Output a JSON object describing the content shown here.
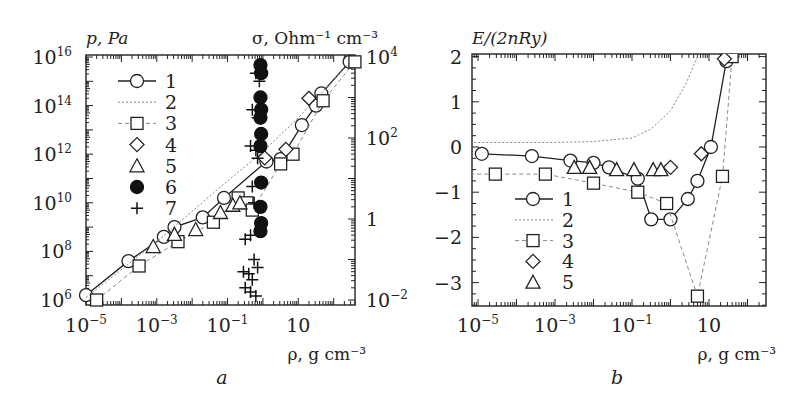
{
  "figure": {
    "panels": [
      "a",
      "b"
    ]
  },
  "chart_data": [
    {
      "panel": "a",
      "type": "scatter",
      "title": "",
      "xlabel": "ρ, g cm⁻³",
      "ylabel_left": "p, Pa",
      "ylabel_right": "σ, Ohm⁻¹ cm⁻³",
      "xscale": "log",
      "yscale_left": "log",
      "yscale_right": "log",
      "xlim": [
        1e-05,
        400
      ],
      "ylim_left": [
        1000000.0,
        1e+16
      ],
      "ylim_right": [
        0.01,
        10000.0
      ],
      "x_ticks": [
        {
          "base": "10",
          "exp": "−5",
          "v": -5
        },
        {
          "base": "10",
          "exp": "−3",
          "v": -3
        },
        {
          "base": "10",
          "exp": "−1",
          "v": -1
        },
        {
          "base": "10",
          "exp": "",
          "v": 1
        }
      ],
      "y_ticks_left": [
        {
          "base": "10",
          "exp": "16",
          "v": 16
        },
        {
          "base": "10",
          "exp": "14",
          "v": 14
        },
        {
          "base": "10",
          "exp": "12",
          "v": 12
        },
        {
          "base": "10",
          "exp": "10",
          "v": 10
        },
        {
          "base": "10",
          "exp": "8",
          "v": 8
        },
        {
          "base": "10",
          "exp": "6",
          "v": 6
        }
      ],
      "y_ticks_right": [
        {
          "base": "10",
          "exp": "4",
          "v": 4
        },
        {
          "base": "10",
          "exp": "2",
          "v": 2
        },
        {
          "base": "1",
          "exp": "",
          "v": 0
        },
        {
          "base": "10",
          "exp": "−2",
          "v": -2
        }
      ],
      "legend": [
        {
          "label": "1",
          "marker": "circle",
          "line": "solid"
        },
        {
          "label": "2",
          "marker": "none",
          "line": "dotted"
        },
        {
          "label": "3",
          "marker": "square",
          "line": "dashed"
        },
        {
          "label": "4",
          "marker": "diamond",
          "line": "none"
        },
        {
          "label": "5",
          "marker": "triangle",
          "line": "none"
        },
        {
          "label": "6",
          "marker": "filled-circle",
          "line": "none"
        },
        {
          "label": "7",
          "marker": "plus",
          "line": "none"
        }
      ],
      "series": [
        {
          "name": "1",
          "axis": "left",
          "marker": "circle",
          "line": "solid",
          "log_x": [
            -5.0,
            -3.8,
            -2.8,
            -2.5,
            -1.7,
            -1.1,
            0.1,
            0.5,
            1.1,
            1.5,
            1.65,
            2.45
          ],
          "log_y": [
            6.2,
            7.6,
            8.6,
            9.0,
            9.4,
            10.2,
            11.7,
            11.8,
            13.2,
            14.0,
            14.5,
            15.8
          ]
        },
        {
          "name": "2",
          "axis": "left",
          "marker": "none",
          "line": "dotted",
          "log_x": [
            -5.0,
            -3.0,
            -1.0,
            0.0,
            1.0,
            2.6
          ],
          "log_y": [
            6.1,
            8.4,
            10.9,
            12.1,
            13.5,
            16.0
          ]
        },
        {
          "name": "3",
          "axis": "left",
          "marker": "square",
          "line": "dashed",
          "log_x": [
            -4.7,
            -3.5,
            -2.4,
            -1.4,
            -0.7,
            -0.45,
            -0.3,
            0.5,
            0.85,
            1.7,
            2.6
          ],
          "log_y": [
            6.0,
            7.4,
            8.4,
            9.2,
            10.2,
            10.0,
            9.7,
            11.6,
            12.0,
            14.2,
            15.8
          ]
        },
        {
          "name": "4",
          "axis": "left",
          "marker": "diamond",
          "line": "none",
          "log_x": [
            0.05,
            0.65,
            1.3
          ],
          "log_y": [
            11.85,
            12.2,
            14.3
          ]
        },
        {
          "name": "5",
          "axis": "left",
          "marker": "triangle",
          "line": "none",
          "log_x": [
            -3.1,
            -2.5,
            -1.9,
            -1.2,
            -0.85,
            -0.65
          ],
          "log_y": [
            8.2,
            8.7,
            8.9,
            9.6,
            9.9,
            10.0
          ]
        },
        {
          "name": "6",
          "axis": "right",
          "marker": "filled-circle",
          "line": "none",
          "log_x": [
            -0.07,
            -0.05,
            -0.07,
            -0.05,
            -0.07,
            -0.05,
            -0.07,
            -0.05,
            -0.07,
            -0.05,
            -0.07
          ],
          "log_y": [
            3.8,
            3.6,
            3.0,
            2.7,
            2.5,
            2.1,
            1.8,
            0.9,
            0.3,
            -0.1,
            -0.3
          ]
        },
        {
          "name": "7",
          "axis": "right",
          "marker": "plus",
          "line": "none",
          "log_x": [
            -0.2,
            -0.1,
            -0.3,
            -0.15,
            -0.35,
            -0.2,
            -0.15,
            -0.3,
            -0.25,
            -0.5,
            -0.35,
            -0.25,
            -0.15,
            -0.55,
            -0.4,
            -0.3,
            -0.5,
            -0.35,
            -0.2
          ],
          "log_y": [
            3.6,
            3.4,
            2.7,
            2.5,
            1.8,
            1.7,
            1.5,
            0.8,
            0.4,
            -0.5,
            -0.4,
            -1.0,
            -1.2,
            -1.3,
            -1.35,
            -1.5,
            -1.7,
            -1.8,
            -1.9
          ]
        }
      ]
    },
    {
      "panel": "b",
      "type": "scatter",
      "title": "",
      "xlabel": "ρ, g cm⁻³",
      "ylabel": "E/(2nRy)",
      "xscale": "log",
      "yscale": "linear",
      "xlim": [
        1e-05,
        2000
      ],
      "ylim": [
        -3.5,
        2.0
      ],
      "x_ticks": [
        {
          "base": "10",
          "exp": "−5",
          "v": -5
        },
        {
          "base": "10",
          "exp": "−3",
          "v": -3
        },
        {
          "base": "10",
          "exp": "−1",
          "v": -1
        },
        {
          "base": "10",
          "exp": "",
          "v": 1
        }
      ],
      "y_ticks": [
        {
          "label": "2",
          "v": 2
        },
        {
          "label": "1",
          "v": 1
        },
        {
          "label": "0",
          "v": 0
        },
        {
          "label": "−1",
          "v": -1
        },
        {
          "label": "−2",
          "v": -2
        },
        {
          "label": "−3",
          "v": -3
        }
      ],
      "legend": [
        {
          "label": "1",
          "marker": "circle",
          "line": "solid"
        },
        {
          "label": "2",
          "marker": "none",
          "line": "dotted"
        },
        {
          "label": "3",
          "marker": "square",
          "line": "dashed"
        },
        {
          "label": "4",
          "marker": "diamond",
          "line": "none"
        },
        {
          "label": "5",
          "marker": "triangle",
          "line": "none"
        }
      ],
      "series": [
        {
          "name": "1",
          "marker": "circle",
          "line": "solid",
          "log_x": [
            -4.9,
            -3.6,
            -2.6,
            -2.0,
            -1.6,
            -0.85,
            -0.5,
            0.0,
            0.45,
            0.7,
            1.05,
            1.45
          ],
          "y": [
            -0.15,
            -0.2,
            -0.3,
            -0.35,
            -0.45,
            -0.7,
            -1.6,
            -1.6,
            -1.15,
            -0.75,
            0.0,
            1.9
          ]
        },
        {
          "name": "2",
          "marker": "none",
          "line": "dotted",
          "log_x": [
            -5.2,
            -3.0,
            -2.0,
            -1.0,
            -0.5,
            0.0,
            0.4,
            0.7,
            0.9,
            1.0
          ],
          "y": [
            0.1,
            0.1,
            0.12,
            0.2,
            0.4,
            0.8,
            1.4,
            2.0,
            2.6,
            3.0
          ]
        },
        {
          "name": "3",
          "marker": "square",
          "line": "dashed",
          "log_x": [
            -5.2,
            -4.55,
            -3.25,
            -2.0,
            -0.85,
            -0.1,
            0.7,
            1.35,
            1.6
          ],
          "y": [
            -0.6,
            -0.6,
            -0.6,
            -0.8,
            -1.0,
            -1.25,
            -3.3,
            -0.65,
            2.0
          ]
        },
        {
          "name": "4",
          "marker": "diamond",
          "line": "none",
          "log_x": [
            0.0,
            0.8,
            1.4
          ],
          "y": [
            -0.45,
            -0.15,
            1.95
          ]
        },
        {
          "name": "5",
          "marker": "triangle",
          "line": "none",
          "log_x": [
            -2.5,
            -2.1,
            -1.4,
            -0.95,
            -0.45,
            -0.25
          ],
          "y": [
            -0.45,
            -0.45,
            -0.5,
            -0.5,
            -0.5,
            -0.5
          ]
        }
      ]
    }
  ]
}
